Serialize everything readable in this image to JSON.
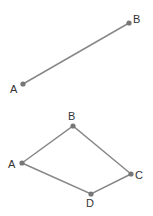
{
  "figure1": {
    "points": [
      {
        "label": "A",
        "x": 23,
        "y": 84,
        "lx": 10,
        "ly": 93
      },
      {
        "label": "B",
        "x": 129,
        "y": 23,
        "lx": 133,
        "ly": 23
      }
    ],
    "segments": [
      [
        "A",
        "B"
      ]
    ]
  },
  "figure2": {
    "points": [
      {
        "label": "A",
        "x": 22,
        "y": 163,
        "lx": 8,
        "ly": 168
      },
      {
        "label": "B",
        "x": 73,
        "y": 126,
        "lx": 68,
        "ly": 120
      },
      {
        "label": "C",
        "x": 131,
        "y": 174,
        "lx": 135,
        "ly": 179
      },
      {
        "label": "D",
        "x": 91,
        "y": 194,
        "lx": 86,
        "ly": 207
      }
    ],
    "segments": [
      [
        "A",
        "B"
      ],
      [
        "B",
        "C"
      ],
      [
        "C",
        "D"
      ],
      [
        "D",
        "A"
      ]
    ]
  },
  "colors": {
    "line": "#888888",
    "point": "#777777",
    "label": "#333333"
  }
}
